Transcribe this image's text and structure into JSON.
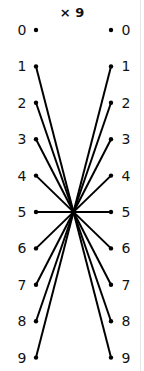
{
  "title": "× 9",
  "multiplier": 9,
  "left_labels": [
    "0",
    "1",
    "2",
    "3",
    "4",
    "5",
    "6",
    "7",
    "8",
    "9"
  ],
  "right_labels": [
    "0",
    "1",
    "2",
    "3",
    "4",
    "5",
    "6",
    "7",
    "8",
    "9"
  ],
  "connections": [
    {
      "from": 1,
      "to": 9
    },
    {
      "from": 2,
      "to": 8
    },
    {
      "from": 3,
      "to": 7
    },
    {
      "from": 4,
      "to": 6
    },
    {
      "from": 5,
      "to": 5
    },
    {
      "from": 6,
      "to": 4
    },
    {
      "from": 7,
      "to": 3
    },
    {
      "from": 8,
      "to": 2
    },
    {
      "from": 9,
      "to": 1
    }
  ],
  "colors": {
    "line": "#000000",
    "text": "#111111",
    "background": "#ffffff"
  }
}
